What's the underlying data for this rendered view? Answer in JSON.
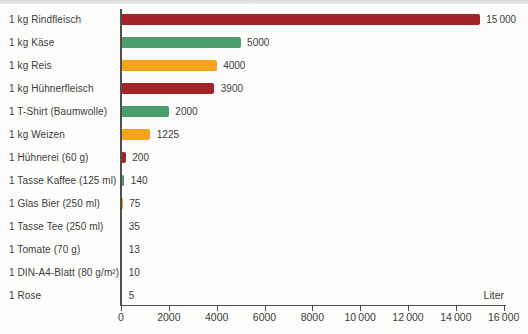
{
  "chart_data": {
    "type": "bar",
    "orientation": "horizontal",
    "title": "",
    "xlabel": "Liter",
    "ylabel": "",
    "xlim": [
      0,
      16000
    ],
    "grid": false,
    "legend": "none",
    "unit_label": "Liter",
    "palette": {
      "red": "#a32328",
      "green": "#4a9d6d",
      "orange": "#f5a21d"
    },
    "axis_color": "#4e4e4e",
    "x_ticks": [
      {
        "value": 0,
        "label": "0"
      },
      {
        "value": 2000,
        "label": "2000"
      },
      {
        "value": 4000,
        "label": "4000"
      },
      {
        "value": 6000,
        "label": "6000"
      },
      {
        "value": 8000,
        "label": "8000"
      },
      {
        "value": 10000,
        "label": "10 000"
      },
      {
        "value": 12000,
        "label": "12 000"
      },
      {
        "value": 14000,
        "label": "14 000"
      },
      {
        "value": 16000,
        "label": "16 000"
      }
    ],
    "items": [
      {
        "label": "1 kg Rindfleisch",
        "value": 15000,
        "value_label": "15 000",
        "color": "red"
      },
      {
        "label": "1 kg Käse",
        "value": 5000,
        "value_label": "5000",
        "color": "green"
      },
      {
        "label": "1 kg Reis",
        "value": 4000,
        "value_label": "4000",
        "color": "orange"
      },
      {
        "label": "1 kg Hühnerfleisch",
        "value": 3900,
        "value_label": "3900",
        "color": "red"
      },
      {
        "label": "1 T-Shirt (Baumwolle)",
        "value": 2000,
        "value_label": "2000",
        "color": "green"
      },
      {
        "label": "1 kg Weizen",
        "value": 1225,
        "value_label": "1225",
        "color": "orange"
      },
      {
        "label": "1 Hühnerei (60 g)",
        "value": 200,
        "value_label": "200",
        "color": "red"
      },
      {
        "label": "1 Tasse Kaffee (125 ml)",
        "value": 140,
        "value_label": "140",
        "color": "green"
      },
      {
        "label": "1 Glas Bier (250 ml)",
        "value": 75,
        "value_label": "75",
        "color": "orange"
      },
      {
        "label": "1 Tasse Tee (250 ml)",
        "value": 35,
        "value_label": "35",
        "color": "red"
      },
      {
        "label": "1 Tomate (70 g)",
        "value": 13,
        "value_label": "13",
        "color": "green"
      },
      {
        "label": "1 DIN-A4-Blatt (80 g/m²)",
        "value": 10,
        "value_label": "10",
        "color": "orange"
      },
      {
        "label": "1 Rose",
        "value": 5,
        "value_label": "5",
        "color": "red"
      }
    ]
  }
}
